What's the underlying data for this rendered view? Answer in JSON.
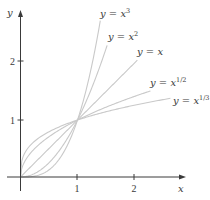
{
  "chart_data": {
    "type": "line",
    "title": "",
    "xlabel": "x",
    "ylabel": "y",
    "xlim": [
      0,
      2.8
    ],
    "ylim": [
      0,
      2.8
    ],
    "grid": false,
    "legend": "inline labels at curve ends",
    "x_ticks": [
      "1",
      "2"
    ],
    "y_ticks": [
      "1",
      "2"
    ],
    "curve_color": "#c9c9c9",
    "axis_color": "#3a3a3a",
    "series": [
      {
        "name": "y = x^3",
        "label_base": "y = x",
        "label_exp": "3",
        "exponent": 3,
        "x_max": 1.4,
        "label_pos": [
          100,
          17
        ]
      },
      {
        "name": "y = x^2",
        "label_base": "y = x",
        "label_exp": "2",
        "exponent": 2,
        "x_max": 1.52,
        "label_pos": [
          108,
          40
        ]
      },
      {
        "name": "y = x",
        "label_base": "y = x",
        "label_exp": "",
        "exponent": 1,
        "x_max": 2.05,
        "label_pos": [
          137,
          55
        ]
      },
      {
        "name": "y = x^1/2",
        "label_base": "y = x",
        "label_exp": "1/2",
        "exponent": 0.5,
        "x_max": 2.28,
        "label_pos": [
          150,
          86
        ]
      },
      {
        "name": "y = x^1/3",
        "label_base": "y = x",
        "label_exp": "1/3",
        "exponent": 0.33333,
        "x_max": 2.63,
        "label_pos": [
          173,
          104
        ]
      }
    ],
    "annotations": [
      "All curves intersect at (1, 1)"
    ]
  },
  "axes": {
    "x_label": "x",
    "y_label": "y",
    "x_tick_labels": [
      "1",
      "2"
    ],
    "y_tick_labels": [
      "1",
      "2"
    ]
  }
}
